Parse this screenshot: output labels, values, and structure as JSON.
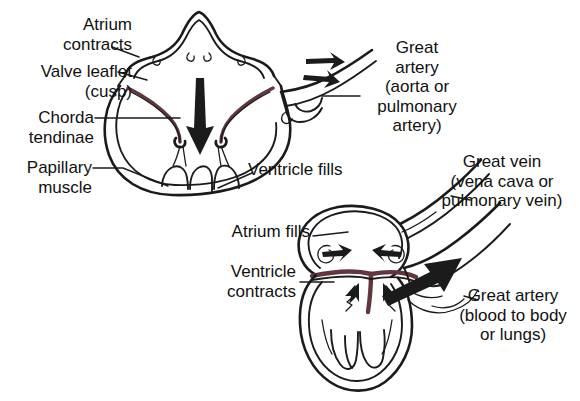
{
  "title": "Normal Heart Valve Function",
  "colors": {
    "background": "#ffffff",
    "ink": "#1b1b1b",
    "valve_leaflet": "#63353f",
    "text": "#111111"
  },
  "diagrams": [
    {
      "name": "ventricular-filling",
      "phase": "Atrial contraction / ventricular filling (diastole)",
      "labels": [
        {
          "id": "atrium-contracts",
          "text": "Atrium\ncontracts"
        },
        {
          "id": "valve-leaflet",
          "text": "Valve leaflet\n(cusp)"
        },
        {
          "id": "chorda-tendinae",
          "text": "Chorda\ntendinae"
        },
        {
          "id": "papillary-muscle",
          "text": "Papillary\nmuscle"
        },
        {
          "id": "great-artery-top",
          "text": "Great\nartery\n(aorta or\npulmonary\nartery)"
        },
        {
          "id": "ventricle-fills",
          "text": "Ventricle fills"
        }
      ]
    },
    {
      "name": "ventricular-contraction",
      "phase": "Ventricular contraction / atrial filling (systole)",
      "labels": [
        {
          "id": "great-vein",
          "text": "Great vein\n(vena cava or\npulmonary vein)"
        },
        {
          "id": "atrium-fills",
          "text": "Atrium fills"
        },
        {
          "id": "ventricle-contracts",
          "text": "Ventricle\ncontracts"
        },
        {
          "id": "great-artery-bottom",
          "text": "Great artery\n(blood to body\nor lungs)"
        }
      ]
    }
  ],
  "labels": {
    "atrium_contracts": "Atrium\ncontracts",
    "valve_leaflet": "Valve leaflet\n(cusp)",
    "chorda_tendinae": "Chorda\ntendinae",
    "papillary_muscle": "Papillary\nmuscle",
    "great_artery_top": "Great\nartery\n(aorta or\npulmonary\nartery)",
    "ventricle_fills": "Ventricle fills",
    "great_vein": "Great vein\n(vena cava or\npulmonary vein)",
    "atrium_fills": "Atrium fills",
    "ventricle_contracts": "Ventricle\ncontracts",
    "great_artery_bottom": "Great artery\n(blood to body\nor lungs)"
  }
}
